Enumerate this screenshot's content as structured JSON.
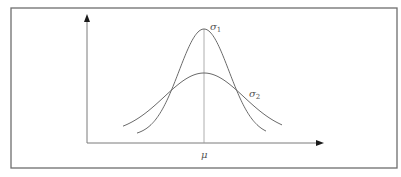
{
  "figure": {
    "labels": {
      "sigma1": "σ",
      "sigma1_sub": "1",
      "sigma2": "σ",
      "sigma2_sub": "2",
      "mean": "μ"
    },
    "colors": {
      "frame": "#6e6e6e",
      "curve": "#6a6a6a",
      "axis": "#7a7a7a",
      "arrow": "#1a1a1a"
    },
    "geometry": {
      "frame": {
        "x": 11,
        "y": 8,
        "w": 386,
        "h": 160
      },
      "origin": {
        "x": 87,
        "y": 143
      },
      "y_axis_top": 15,
      "x_axis_right": 323,
      "mean_x": 204,
      "curves": [
        {
          "name": "sigma1",
          "peak_y": 29,
          "base_y": 136,
          "sd_px": 25,
          "x_start": 137,
          "x_end": 266
        },
        {
          "name": "sigma2",
          "peak_y": 73,
          "base_y": 134,
          "sd_px": 40,
          "x_start": 123,
          "x_end": 282
        }
      ]
    }
  }
}
